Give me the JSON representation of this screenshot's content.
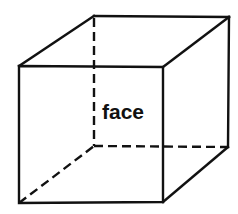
{
  "diagram": {
    "type": "wireframe-cube",
    "label": "face",
    "colors": {
      "line": "#111111",
      "background": "#ffffff"
    },
    "front_face": {
      "tl": [
        19,
        66
      ],
      "tr": [
        163,
        67
      ],
      "br": [
        163,
        202
      ],
      "bl": [
        19,
        203
      ]
    },
    "back_face": {
      "tl": [
        94,
        16
      ],
      "tr": [
        229,
        17
      ],
      "br": [
        228,
        147
      ],
      "bl": [
        94,
        146
      ]
    },
    "hidden_edges": [
      "back-left-vertical",
      "back-bottom-horizontal",
      "bottom-left-diagonal"
    ]
  }
}
